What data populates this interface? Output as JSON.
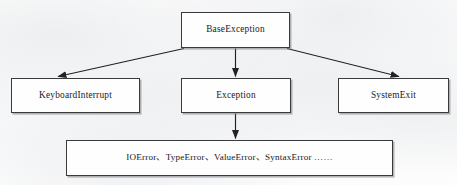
{
  "diagram": {
    "type": "tree",
    "background_color": "#fcfcfc",
    "line_color": "#222224",
    "box_border_color": "#3a3a3c",
    "box_fill_color": "#fefefe",
    "text_color": "#18181a",
    "nodes": {
      "base_exception": {
        "label": "BaseException"
      },
      "keyboard_interrupt": {
        "label": "KeyboardInterrupt"
      },
      "exception": {
        "label": "Exception"
      },
      "system_exit": {
        "label": "SystemExit"
      },
      "concrete_errors": {
        "label": "IOError、TypeError、ValueError、SyntaxError ……"
      }
    },
    "edges": [
      {
        "from": "BaseException",
        "to": "KeyboardInterrupt",
        "style": "arrow",
        "direction": "down-left"
      },
      {
        "from": "BaseException",
        "to": "Exception",
        "style": "arrow",
        "direction": "down"
      },
      {
        "from": "BaseException",
        "to": "SystemExit",
        "style": "arrow",
        "direction": "down-right"
      },
      {
        "from": "Exception",
        "to": "IOError、TypeError、ValueError、SyntaxError ……",
        "style": "arrow",
        "direction": "down"
      }
    ]
  }
}
